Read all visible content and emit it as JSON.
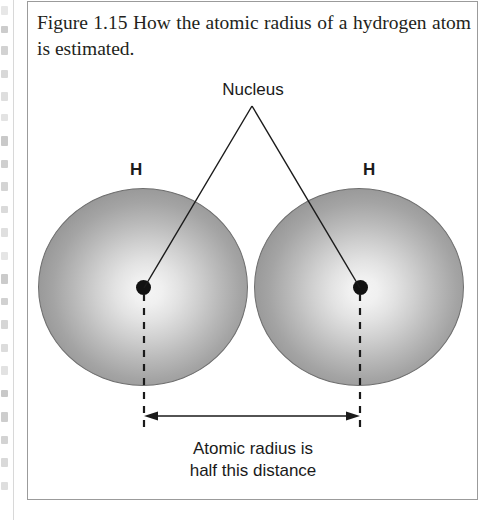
{
  "figure": {
    "caption_label": "Figure 1.15",
    "caption_text": "How the atomic radius of a hydrogen atom is estimated.",
    "caption_full": "Figure 1.15   How the atomic radius of a hydrogen atom is estimated."
  },
  "diagram": {
    "nucleus_label": "Nucleus",
    "atom_label_left": "H",
    "atom_label_right": "H",
    "dimension_line1": "Atomic radius is",
    "dimension_line2": "half this distance",
    "spheres": [
      {
        "name": "hydrogen-atom-left",
        "label": "H",
        "center_x": 116,
        "center_y": 286,
        "radius_x": 105,
        "radius_y": 99
      },
      {
        "name": "hydrogen-atom-right",
        "label": "H",
        "center_x": 332,
        "center_y": 286,
        "radius_x": 105,
        "radius_y": 99
      }
    ],
    "nuclei": [
      {
        "name": "nucleus-left",
        "center_x": 116,
        "center_y": 286,
        "radius": 7.5
      },
      {
        "name": "nucleus-right",
        "center_x": 332,
        "center_y": 286,
        "radius": 7.5
      }
    ],
    "leader_lines": [
      {
        "from_x": 224,
        "from_y": 104,
        "to_x": 116,
        "to_y": 286
      },
      {
        "from_x": 224,
        "from_y": 104,
        "to_x": 332,
        "to_y": 286
      }
    ],
    "dimension_arrow": {
      "x_start": 116,
      "x_end": 332,
      "y": 414
    },
    "dashed_lines": [
      {
        "x": 116,
        "y_start": 286,
        "y_end": 430
      },
      {
        "x": 332,
        "y_start": 286,
        "y_end": 430
      }
    ]
  },
  "colors": {
    "sphere_edge": "#8a8a8a",
    "sphere_center": "#f4f4f4",
    "sphere_outline": "#6e6e6e",
    "nucleus_fill": "#111111",
    "line": "#1a1a1a",
    "box_border": "#9b9b9b",
    "caption_text": "#231f20",
    "page_background": "#ffffff",
    "bleed_fragment": "#b9b9b9"
  },
  "bleed_edge": {
    "description": "cut-off text fragments from adjacent page column",
    "fragments": [
      {
        "top": 6,
        "height": 9
      },
      {
        "top": 26,
        "height": 7
      },
      {
        "top": 46,
        "height": 9
      },
      {
        "top": 70,
        "height": 8
      },
      {
        "top": 92,
        "height": 9
      },
      {
        "top": 114,
        "height": 7
      },
      {
        "top": 136,
        "height": 10
      },
      {
        "top": 160,
        "height": 8
      },
      {
        "top": 182,
        "height": 9
      },
      {
        "top": 206,
        "height": 7
      },
      {
        "top": 228,
        "height": 9
      },
      {
        "top": 252,
        "height": 8
      },
      {
        "top": 274,
        "height": 10
      },
      {
        "top": 298,
        "height": 7
      },
      {
        "top": 320,
        "height": 9
      },
      {
        "top": 344,
        "height": 8
      },
      {
        "top": 366,
        "height": 9
      },
      {
        "top": 390,
        "height": 7
      },
      {
        "top": 412,
        "height": 10
      },
      {
        "top": 436,
        "height": 8
      },
      {
        "top": 458,
        "height": 9
      },
      {
        "top": 482,
        "height": 8
      }
    ]
  }
}
